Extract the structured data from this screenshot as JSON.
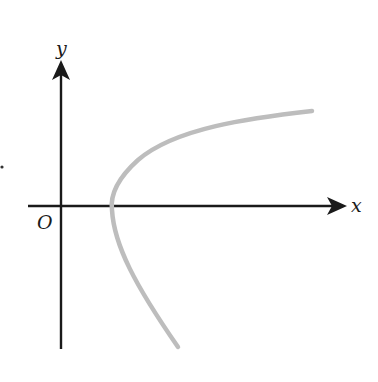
{
  "diagram": {
    "type": "coordinate-plane-curve",
    "axes": {
      "x_label": "x",
      "y_label": "y",
      "origin_label": "O",
      "axis_color": "#1a1a1a"
    },
    "curve": {
      "shape": "parabola-opening-right",
      "color": "#bdbdbd",
      "vertex_position": "on positive x-axis, right of origin",
      "upper_branch": "extends up and to the right",
      "lower_branch": "extends down and to the right"
    },
    "marks": {
      "stray_dot": true
    }
  }
}
